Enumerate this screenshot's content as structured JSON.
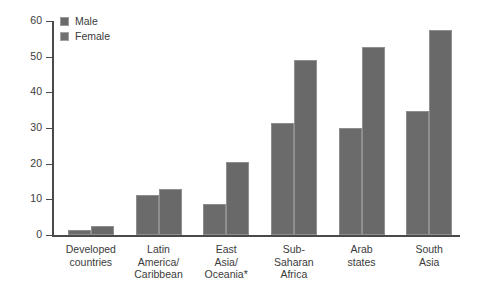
{
  "chart_data": {
    "type": "bar",
    "title": "",
    "xlabel": "",
    "ylabel": "Percentage illiterate",
    "ylim": [
      0,
      60
    ],
    "ytick_labels": [
      "0",
      "10",
      "20",
      "30",
      "40",
      "50",
      "60"
    ],
    "yticks": [
      0,
      10,
      20,
      30,
      40,
      50,
      60
    ],
    "grid": false,
    "legend_position": "top-left",
    "categories": [
      "Developed countries",
      "Latin America/ Caribbean",
      "East Asia/ Oceania*",
      "Sub-Saharan Africa",
      "Arab states",
      "South Asia"
    ],
    "category_lines": [
      [
        "Developed",
        "countries"
      ],
      [
        "Latin",
        "America/",
        "Caribbean"
      ],
      [
        "East",
        "Asia/",
        "Oceania*"
      ],
      [
        "Sub-",
        "Saharan",
        "Africa"
      ],
      [
        "Arab",
        "states"
      ],
      [
        "South",
        "Asia"
      ]
    ],
    "series": [
      {
        "name": "Male",
        "color": "#6b6b6b",
        "values": [
          1.3,
          11.2,
          8.7,
          31.5,
          30.0,
          34.7
        ]
      },
      {
        "name": "Female",
        "color": "#696969",
        "values": [
          2.6,
          13.0,
          20.5,
          49.0,
          52.8,
          57.5
        ]
      }
    ]
  },
  "legend": {
    "items": [
      {
        "label": "Male"
      },
      {
        "label": "Female"
      }
    ]
  },
  "colors": {
    "bar_male": "#6b6b6b",
    "bar_female": "#696969",
    "axis": "#4a4a4a",
    "text": "#3b3b3b",
    "background": "#ffffff"
  }
}
